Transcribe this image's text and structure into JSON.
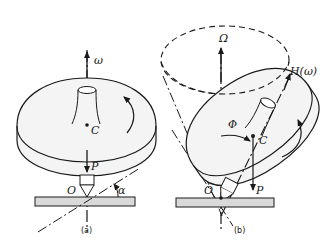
{
  "diagram": {
    "panels": [
      {
        "caption": "(a)",
        "labels": {
          "omega": "ω",
          "center": "C",
          "force": "P",
          "origin": "O",
          "angle": "α"
        }
      },
      {
        "caption": "(b)",
        "labels": {
          "precession": "Ω",
          "angular_momentum": "H(ω)",
          "tilt": "Φ",
          "center": "C",
          "force": "P",
          "origin": "O"
        }
      }
    ],
    "colors": {
      "stroke": "#1a1a1a",
      "disk_fill": "#f2f2f2",
      "base_fill": "#d9d9d9",
      "background": "#ffffff"
    }
  }
}
